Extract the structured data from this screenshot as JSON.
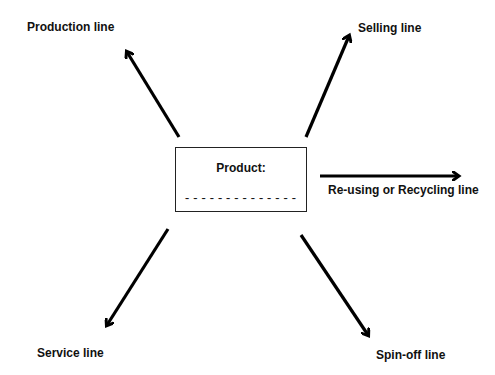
{
  "diagram": {
    "center": {
      "title": "Product:",
      "blank": "--------------"
    },
    "branches": [
      {
        "label": "Production line",
        "direction": "up-left"
      },
      {
        "label": "Selling line",
        "direction": "up-right"
      },
      {
        "label": "Re-using or Recycling line",
        "direction": "right"
      },
      {
        "label": "Service line",
        "direction": "down-left"
      },
      {
        "label": "Spin-off line",
        "direction": "down-right"
      }
    ],
    "colors": {
      "arrow": "#000000",
      "text": "#111111",
      "background": "#ffffff"
    }
  }
}
